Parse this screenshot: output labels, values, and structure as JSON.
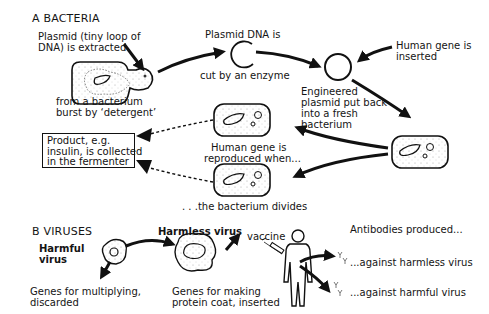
{
  "section_a": {
    "heading": "A  BACTERIA",
    "labels": {
      "plasmid_extracted": [
        "Plasmid (tiny loop of",
        "DNA) is extracted"
      ],
      "from_bacterium": [
        "from a bacterium",
        "burst by ‘detergent’"
      ],
      "plasmid_cut_top": "Plasmid DNA is",
      "plasmid_cut_bottom": "cut by an enzyme",
      "human_gene_inserted": [
        "Human gene is",
        "inserted"
      ],
      "engineered_plasmid": [
        "Engineered",
        "plasmid put back",
        "into a fresh",
        "bacterium"
      ],
      "human_gene_reproduced": [
        "Human gene is",
        "reproduced when..."
      ],
      "bacterium_divides": ". . .the bacterium divides",
      "product": "Product, e.g.\ninsulin, is collected\nin the fermenter"
    }
  },
  "section_b": {
    "heading": "B  VIRUSES",
    "labels": {
      "harmful_virus": [
        "Harmful",
        "virus"
      ],
      "harmless_virus": "Harmless virus",
      "genes_multiplying": [
        "Genes for multiplying,",
        "discarded"
      ],
      "genes_protein_coat": [
        "Genes for making",
        "protein coat, inserted"
      ],
      "vaccine": "vaccine",
      "antibodies_produced": "Antibodies produced...",
      "against_harmless": "...against harmless virus",
      "against_harmful": "...against harmful virus"
    }
  },
  "colors": {
    "ink": "#141414",
    "background": "#ffffff"
  }
}
